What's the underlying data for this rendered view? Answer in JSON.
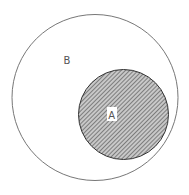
{
  "diagram": {
    "type": "venn-subset",
    "outer_set": {
      "label": "B",
      "fill": "#ffffff",
      "stroke": "#777777"
    },
    "inner_set": {
      "label": "A",
      "fill": "#9a9a9a",
      "stroke": "#333333",
      "pattern": "diagonal-hatch"
    },
    "relation": "A is a subset of B"
  }
}
